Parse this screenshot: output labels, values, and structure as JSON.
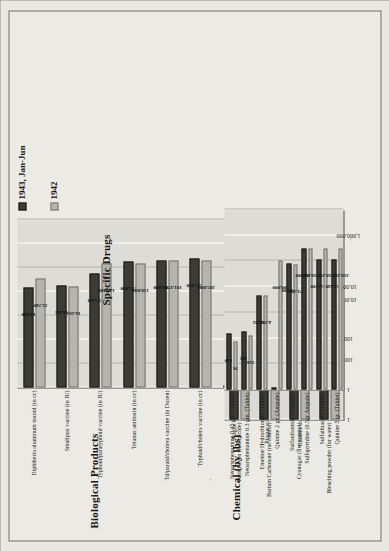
{
  "legend": {
    "series": [
      {
        "key": "s1",
        "label": "1943, Jan-Jun",
        "color": "#3b3b38"
      },
      {
        "key": "s2",
        "label": "1942",
        "color": "#b6b4ae"
      }
    ]
  },
  "chart_data": [
    {
      "type": "bar",
      "id": "biological-products",
      "title": "Biological Products",
      "orientation": "horizontal",
      "scale": "log",
      "xlim": [
        1,
        10000000
      ],
      "ticks": [
        "1",
        "100",
        "10,000",
        "1,000,000"
      ],
      "grid": true,
      "legend_position": "top-right",
      "categories": [
        "Diphtheria aluminum toxoid (in cc)",
        "Smallpox vaccine (in IU)",
        "Typhoid/paratyphoid vaccine (in IU)",
        "Tetanus antitoxin (in cc)",
        "Td/paratd/cholera vaccine (in Dozen)",
        "Typhoid/cholera vaccine (in cc)",
        "Plague serum (in cc)",
        "Plague vaccine (in cc)",
        "Cholera vaccine (in cc)"
      ],
      "series": [
        {
          "name": "1943, Jan-Jun",
          "values": [
            14200,
            18111,
            57320,
            175000,
            204800,
            227600,
            0,
            566200,
            1462340
          ],
          "labels": [
            "14,200",
            "18,111",
            "57,320",
            "175,000",
            "204,800",
            "227,600",
            "",
            "566,200",
            "1,462,340"
          ]
        },
        {
          "name": "1942",
          "values": [
            35740,
            16161,
            142480,
            150030,
            191370,
            205000,
            705000,
            2105910,
            1463400
          ],
          "labels": [
            "35,740",
            "16,161",
            "142,480",
            "150,030",
            "191,370",
            "205,000",
            "705,000",
            "2,105,910",
            "1,463,400"
          ]
        }
      ]
    },
    {
      "type": "bar",
      "id": "chemical-by-lbs",
      "title": "Chemical (by lbs)",
      "orientation": "horizontal",
      "scale": "log",
      "xlim": [
        1,
        10000
      ],
      "ticks": [
        "1",
        "100",
        "10,000"
      ],
      "grid": true,
      "categories": [
        "Paris Green (insecticide)",
        "Barium Carbonate (rat control)",
        "Cyanogas (flea control)",
        "Bleaching powder (for water)"
      ],
      "series": [
        {
          "name": "1943, Jan-Jun",
          "values": [
            1350,
            150,
            250,
            4550
          ],
          "labels": [
            "1,350",
            "150",
            "250",
            "4,550"
          ]
        },
        {
          "name": "1942",
          "values": [
            550,
            650,
            875,
            5052
          ],
          "labels": [
            "550",
            "650",
            "875",
            "5,052"
          ]
        }
      ]
    },
    {
      "type": "bar",
      "id": "specific-drugs",
      "title": "Specific Drugs",
      "orientation": "horizontal",
      "scale": "log",
      "xlim": [
        1,
        10000000
      ],
      "ticks": [
        "1",
        "100",
        "10,000",
        "1,000,000"
      ],
      "grid": true,
      "categories": [
        "Neoarsphenamine 0.45 gm. (Tablet)",
        "Neoarsphenamine 0.3 gm. (Tablet)",
        "Emetine Hydrochloride (Tablet)",
        "Quinine 2 gr. (Ampule)",
        "Sulfanilamide  (Ampule)",
        "Sulfapyridine  (0.5gr Ampule)",
        "Sulfathiazole  (Tablet)",
        "Quinine 5 gr. (Tablet)"
      ],
      "series": [
        {
          "name": "1943, Jan-Jun",
          "values": [
            150,
            185,
            4502,
            0,
            81100,
            311000,
            114100,
            112240
          ],
          "labels": [
            "150",
            "185",
            "4,502",
            "",
            "81,100",
            "311,000",
            "114,100",
            "112,240"
          ]
        },
        {
          "name": "1942",
          "values": [
            76,
            126,
            4502,
            100000,
            71200,
            318000,
            318100,
            318100
          ],
          "labels": [
            "76",
            "126",
            "4,502",
            "100,000",
            "71,200",
            "318,000",
            "318,100",
            "318,100"
          ]
        }
      ]
    }
  ]
}
